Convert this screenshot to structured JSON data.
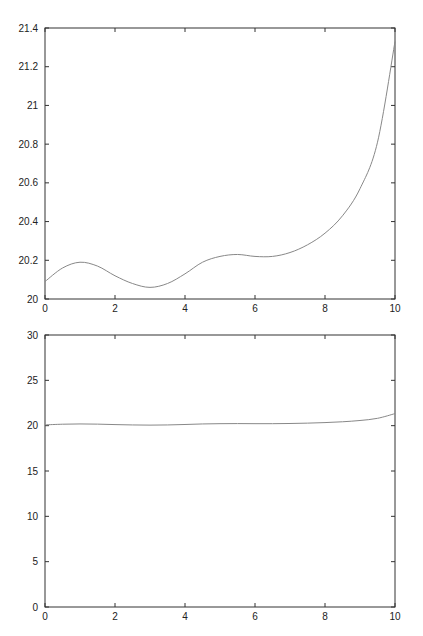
{
  "chart_data": [
    {
      "type": "line",
      "title": "",
      "xlabel": "",
      "ylabel": "",
      "xlim": [
        0,
        10
      ],
      "ylim": [
        20,
        21.4
      ],
      "grid": false,
      "legend": null,
      "xticks": [
        "0",
        "2",
        "4",
        "6",
        "8",
        "10"
      ],
      "yticks": [
        "20",
        "20.2",
        "20.4",
        "20.6",
        "20.8",
        "21",
        "21.2",
        "21.4"
      ],
      "series": [
        {
          "name": "curve",
          "color": "#888888",
          "x": [
            0,
            0.5,
            1,
            1.5,
            2,
            2.5,
            3,
            3.5,
            4,
            4.5,
            5,
            5.5,
            6,
            6.5,
            7,
            7.5,
            8,
            8.5,
            9,
            9.5,
            10
          ],
          "y": [
            20.09,
            20.16,
            20.19,
            20.17,
            20.12,
            20.08,
            20.06,
            20.08,
            20.13,
            20.19,
            20.22,
            20.23,
            20.22,
            20.22,
            20.24,
            20.28,
            20.34,
            20.43,
            20.57,
            20.81,
            21.33
          ]
        }
      ]
    },
    {
      "type": "line",
      "title": "",
      "xlabel": "",
      "ylabel": "",
      "xlim": [
        0,
        10
      ],
      "ylim": [
        0,
        30
      ],
      "grid": false,
      "legend": null,
      "xticks": [
        "0",
        "2",
        "4",
        "6",
        "8",
        "10"
      ],
      "yticks": [
        "0",
        "5",
        "10",
        "15",
        "20",
        "25",
        "30"
      ],
      "series": [
        {
          "name": "curve",
          "color": "#888888",
          "x": [
            0,
            0.5,
            1,
            1.5,
            2,
            2.5,
            3,
            3.5,
            4,
            4.5,
            5,
            5.5,
            6,
            6.5,
            7,
            7.5,
            8,
            8.5,
            9,
            9.5,
            10
          ],
          "y": [
            20.09,
            20.16,
            20.19,
            20.17,
            20.12,
            20.08,
            20.06,
            20.08,
            20.13,
            20.19,
            20.22,
            20.23,
            20.22,
            20.22,
            20.24,
            20.28,
            20.34,
            20.43,
            20.57,
            20.81,
            21.33
          ]
        }
      ]
    }
  ],
  "layout": {
    "panels": [
      {
        "left": 45,
        "right": 395,
        "top": 28,
        "bottom": 299
      },
      {
        "left": 45,
        "right": 395,
        "top": 335,
        "bottom": 607
      }
    ]
  }
}
